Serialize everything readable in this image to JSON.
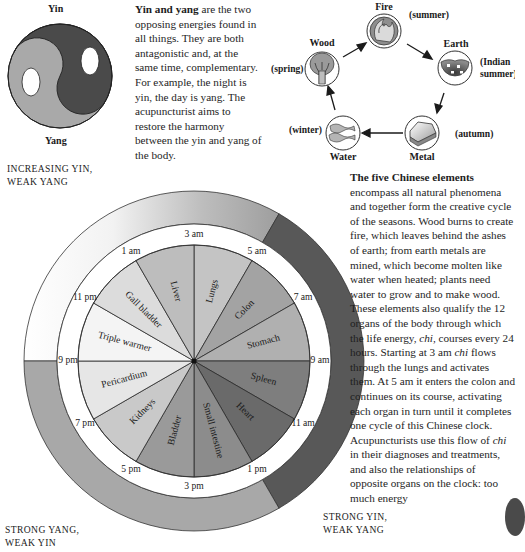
{
  "yin_yang": {
    "top_label": "Yin",
    "bottom_label": "Yang",
    "colors": {
      "yin": "#4a4a4a",
      "yang": "#a9a9a9"
    },
    "paragraph": {
      "lead": "Yin and yang",
      "body": " are the two opposing energies found in all things. They are both antagonistic and, at the same time, complementary. For example, the night is yin, the day is yang. The acupuncturist aims to restore the harmony between the yin and yang of the body."
    }
  },
  "five_elements": {
    "items": [
      {
        "name": "Fire",
        "season": "(summer)",
        "icon": "flame-icon"
      },
      {
        "name": "Earth",
        "season": "(Indian summer)",
        "season_lines": [
          "(Indian",
          "summer)"
        ],
        "icon": "soil-icon"
      },
      {
        "name": "Metal",
        "season": "(autumn)",
        "icon": "metal-ingot-icon"
      },
      {
        "name": "Water",
        "season": "(winter)",
        "icon": "waves-icon"
      },
      {
        "name": "Wood",
        "season": "(spring)",
        "icon": "tree-icon"
      }
    ],
    "cycle_order": [
      "Wood",
      "Fire",
      "Earth",
      "Metal",
      "Water",
      "Wood"
    ],
    "paragraph": {
      "lead": "The five Chinese elements",
      "part1": " encompass all natural phenomena and together form the creative cycle of the seasons. Wood burns to create fire, which leaves behind the ashes of earth; from earth metals are mined, which become molten like water when heated; plants need water to grow and to make wood. These elements also qualify the 12 organs of the body through which the life energy, ",
      "chi1": "chi",
      "part2": ", courses every 24 hours. Starting at 3 am ",
      "chi2": "chi",
      "part3": " flows through the lungs and activates them. At 5 am it enters the colon and continues on its course, activating each organ in turn until it completes one cycle of this Chinese clock. Acupuncturists use this flow of ",
      "chi3": "chi",
      "part4": " in their diagnoses and treatments, and also the relationships of opposite organs on the clock: too much energy"
    }
  },
  "organ_clock": {
    "zones": [
      {
        "label_lines": [
          "INCREASING YIN,",
          "WEAK YANG"
        ],
        "position": "top-left",
        "fill": "gradient white to grey"
      },
      {
        "label_lines": [
          "STRONG YIN,",
          "WEAK YANG"
        ],
        "position": "bottom-right",
        "fill": "#585858"
      },
      {
        "label_lines": [
          "STRONG YANG,",
          "WEAK YIN"
        ],
        "position": "bottom-left",
        "fill": "#a8a8a8"
      }
    ],
    "hours": [
      "3 am",
      "5 am",
      "7 am",
      "9 am",
      "11 am",
      "1 pm",
      "3 pm",
      "5 pm",
      "7 pm",
      "9 pm",
      "11 pm",
      "1 am"
    ],
    "organs": [
      {
        "name": "Lungs",
        "start": "3 am",
        "end": "5 am",
        "fill": "#c4c4c4"
      },
      {
        "name": "Colon",
        "start": "5 am",
        "end": "7 am",
        "fill": "#a3a3a3"
      },
      {
        "name": "Stomach",
        "start": "7 am",
        "end": "9 am",
        "fill": "#b0b0b0"
      },
      {
        "name": "Spleen",
        "start": "9 am",
        "end": "11 am",
        "fill": "#7e7e7e"
      },
      {
        "name": "Heart",
        "start": "11 am",
        "end": "1 pm",
        "fill": "#6a6a6a"
      },
      {
        "name": "Small intestine",
        "start": "1 pm",
        "end": "3 pm",
        "fill": "#8c8c8c"
      },
      {
        "name": "Bladder",
        "start": "3 pm",
        "end": "5 pm",
        "fill": "#9a9a9a"
      },
      {
        "name": "Kidneys",
        "start": "5 pm",
        "end": "7 pm",
        "fill": "#c9c9c9"
      },
      {
        "name": "Pericardium",
        "start": "7 pm",
        "end": "9 pm",
        "fill": "#e6e6e6"
      },
      {
        "name": "Triple warmer",
        "start": "9 pm",
        "end": "11 pm",
        "fill": "#f4f4f4"
      },
      {
        "name": "Gall bladder",
        "start": "11 pm",
        "end": "1 am",
        "fill": "#dcdcdc"
      },
      {
        "name": "Liver",
        "start": "1 am",
        "end": "3 am",
        "fill": "#bdbdbd"
      }
    ]
  }
}
